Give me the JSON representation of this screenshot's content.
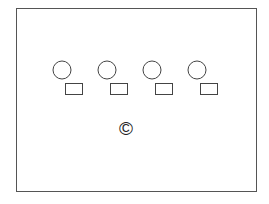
{
  "diagram": {
    "frame": {
      "x": 16,
      "y": 8,
      "width": 240,
      "height": 183,
      "stroke": "#555555"
    },
    "circles": [
      {
        "cx": 62,
        "cy": 70,
        "r": 9
      },
      {
        "cx": 107,
        "cy": 70,
        "r": 9
      },
      {
        "cx": 152,
        "cy": 70,
        "r": 9
      },
      {
        "cx": 197,
        "cy": 70,
        "r": 9
      }
    ],
    "rects": [
      {
        "x": 65,
        "y": 83,
        "width": 17,
        "height": 11
      },
      {
        "x": 110,
        "y": 83,
        "width": 17,
        "height": 11
      },
      {
        "x": 155,
        "y": 83,
        "width": 17,
        "height": 11
      },
      {
        "x": 200,
        "y": 83,
        "width": 17,
        "height": 11
      }
    ],
    "label": {
      "text": "©",
      "x": 117,
      "y": 120
    }
  }
}
